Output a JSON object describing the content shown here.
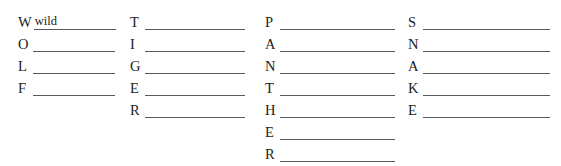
{
  "worksheet": {
    "type": "acrostic-blank-lines",
    "background_color": "#ffffff",
    "line_color": "#555a5f",
    "text_color": "#1c1c1c",
    "columns": [
      {
        "word": "WOLF",
        "left": 18,
        "line_width": 82,
        "rows": [
          {
            "letter": "W",
            "answer": "wild"
          },
          {
            "letter": "O",
            "answer": ""
          },
          {
            "letter": "L",
            "answer": ""
          },
          {
            "letter": "F",
            "answer": ""
          }
        ]
      },
      {
        "word": "TIGER",
        "left": 130,
        "line_width": 100,
        "rows": [
          {
            "letter": "T",
            "answer": ""
          },
          {
            "letter": "I",
            "answer": ""
          },
          {
            "letter": "G",
            "answer": ""
          },
          {
            "letter": "E",
            "answer": ""
          },
          {
            "letter": "R",
            "answer": ""
          }
        ]
      },
      {
        "word": "PANTHER",
        "left": 265,
        "line_width": 115,
        "rows": [
          {
            "letter": "P",
            "answer": ""
          },
          {
            "letter": "A",
            "answer": ""
          },
          {
            "letter": "N",
            "answer": ""
          },
          {
            "letter": "T",
            "answer": ""
          },
          {
            "letter": "H",
            "answer": ""
          },
          {
            "letter": "E",
            "answer": ""
          },
          {
            "letter": "R",
            "answer": ""
          }
        ]
      },
      {
        "word": "SNAKE",
        "left": 408,
        "line_width": 127,
        "rows": [
          {
            "letter": "S",
            "answer": ""
          },
          {
            "letter": "N",
            "answer": ""
          },
          {
            "letter": "A",
            "answer": ""
          },
          {
            "letter": "K",
            "answer": ""
          },
          {
            "letter": "E",
            "answer": ""
          }
        ]
      }
    ],
    "layout": {
      "first_row_top": 8,
      "row_spacing": 22,
      "letter_gutter": 13
    }
  }
}
